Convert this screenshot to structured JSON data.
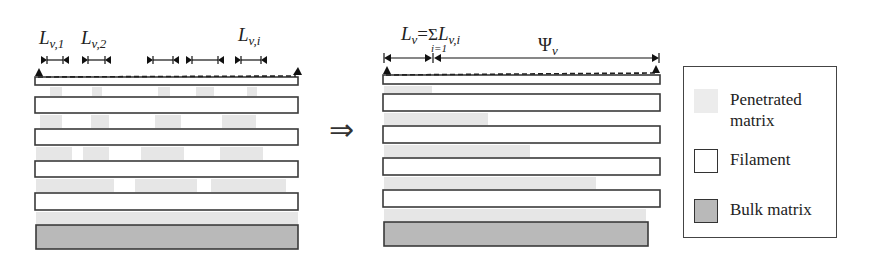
{
  "left_panel": {
    "labels": {
      "l1": {
        "main": "L",
        "sub": "v,1"
      },
      "l2": {
        "main": "L",
        "sub": "v,2"
      },
      "li": {
        "main": "L",
        "sub": "v,i"
      }
    },
    "segment_markers": [
      {
        "x1": 44,
        "x2": 66
      },
      {
        "x1": 85,
        "x2": 108
      },
      {
        "x1": 150,
        "x2": 176
      },
      {
        "x1": 189,
        "x2": 221
      },
      {
        "x1": 238,
        "x2": 264
      }
    ],
    "filaments": [
      {
        "y": 77,
        "h": 8
      },
      {
        "y": 97,
        "h": 16
      },
      {
        "y": 129,
        "h": 16
      },
      {
        "y": 161,
        "h": 16
      },
      {
        "y": 193,
        "h": 17
      }
    ],
    "penetrated_patches": [
      {
        "x": 50,
        "y": 87,
        "w": 12,
        "h": 9
      },
      {
        "x": 92,
        "y": 87,
        "w": 10,
        "h": 9
      },
      {
        "x": 158,
        "y": 87,
        "w": 12,
        "h": 9
      },
      {
        "x": 196,
        "y": 87,
        "w": 18,
        "h": 9
      },
      {
        "x": 247,
        "y": 87,
        "w": 10,
        "h": 9
      },
      {
        "x": 40,
        "y": 115,
        "w": 22,
        "h": 13
      },
      {
        "x": 91,
        "y": 115,
        "w": 18,
        "h": 13
      },
      {
        "x": 155,
        "y": 115,
        "w": 26,
        "h": 13
      },
      {
        "x": 222,
        "y": 115,
        "w": 34,
        "h": 13
      },
      {
        "x": 36,
        "y": 147,
        "w": 36,
        "h": 13
      },
      {
        "x": 83,
        "y": 147,
        "w": 26,
        "h": 13
      },
      {
        "x": 141,
        "y": 147,
        "w": 43,
        "h": 13
      },
      {
        "x": 220,
        "y": 147,
        "w": 43,
        "h": 13
      },
      {
        "x": 36,
        "y": 179,
        "w": 78,
        "h": 13
      },
      {
        "x": 135,
        "y": 179,
        "w": 62,
        "h": 13
      },
      {
        "x": 211,
        "y": 179,
        "w": 75,
        "h": 13
      },
      {
        "x": 36,
        "y": 212,
        "w": 262,
        "h": 12
      }
    ],
    "bulk": {
      "x": 36,
      "y": 225,
      "w": 262,
      "h": 24
    }
  },
  "arrow": {
    "glyph": "⇒"
  },
  "right_panel": {
    "label_lv": {
      "main": "L",
      "sub": "v",
      "eq": "=",
      "sigma": "Σ",
      "index": "i=1",
      "term_main": "L",
      "term_sub": "v,i"
    },
    "label_psi": {
      "main": "Ψ",
      "sub": "v"
    },
    "dimension": {
      "x_start": 384,
      "x_split": 433,
      "x_end": 659,
      "y": 58
    },
    "filaments": [
      {
        "y": 75,
        "h": 9
      },
      {
        "y": 94,
        "h": 17
      },
      {
        "y": 126,
        "h": 17
      },
      {
        "y": 158,
        "h": 17
      },
      {
        "y": 190,
        "h": 17
      }
    ],
    "penetrated_patches": [
      {
        "x": 384,
        "y": 86,
        "w": 48,
        "h": 7
      },
      {
        "x": 384,
        "y": 113,
        "w": 104,
        "h": 12
      },
      {
        "x": 384,
        "y": 145,
        "w": 146,
        "h": 12
      },
      {
        "x": 384,
        "y": 177,
        "w": 212,
        "h": 12
      },
      {
        "x": 384,
        "y": 209,
        "w": 262,
        "h": 12
      }
    ],
    "bulk": {
      "x": 384,
      "y": 222,
      "w": 264,
      "h": 24
    }
  },
  "legend": {
    "items": [
      {
        "label_line1": "Penetrated",
        "label_line2": "matrix",
        "type": "penetrated"
      },
      {
        "label_line1": "Filament",
        "label_line2": "",
        "type": "filament"
      },
      {
        "label_line1": "Bulk matrix",
        "label_line2": "",
        "type": "bulk"
      }
    ]
  },
  "colors": {
    "stroke": "#3a3a3a",
    "filament_fill": "#ffffff",
    "bulk_fill": "#b9b9b9",
    "penetrated_fill": "#e6e6e6",
    "background": "#ffffff"
  }
}
